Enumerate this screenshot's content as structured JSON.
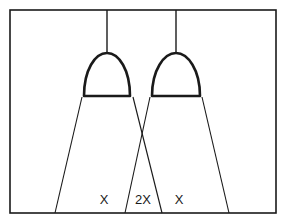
{
  "diagram": {
    "colors": {
      "stroke": "#1a1a1a",
      "background": "#ffffff"
    },
    "frame": {
      "x": 10,
      "y": 10,
      "width": 266,
      "height": 203
    },
    "lamps": [
      {
        "id": "lamp-left",
        "cord_x": 107,
        "dome_left": 84,
        "dome_right": 130,
        "dome_top": 52,
        "dome_bottom": 96
      },
      {
        "id": "lamp-right",
        "cord_x": 176,
        "dome_left": 152,
        "dome_right": 200,
        "dome_top": 52,
        "dome_bottom": 96
      }
    ],
    "beams": [
      {
        "id": "beam-left",
        "top_left": [
          82,
          96
        ],
        "bottom_left": [
          55,
          213
        ],
        "top_right": [
          133,
          96
        ],
        "bottom_right": [
          162,
          213
        ]
      },
      {
        "id": "beam-right",
        "top_left": [
          150,
          96
        ],
        "bottom_left": [
          125,
          213
        ],
        "top_right": [
          202,
          96
        ],
        "bottom_right": [
          229,
          213
        ]
      }
    ],
    "labels": [
      {
        "text": "X",
        "x": 104,
        "y": 199
      },
      {
        "text": "2X",
        "x": 143,
        "y": 199
      },
      {
        "text": "X",
        "x": 179,
        "y": 199
      }
    ]
  }
}
